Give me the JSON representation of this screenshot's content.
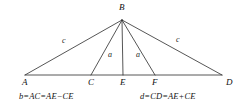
{
  "figure": {
    "type": "geometry-diagram",
    "background_color": "#ffffff",
    "stroke_color": "#2b2b2b",
    "stroke_width": 0.8,
    "canvas": {
      "width": 245,
      "height": 110
    },
    "points": [
      {
        "id": "A",
        "label": "A",
        "x": 25,
        "y": 75,
        "label_x": 22,
        "label_y": 78
      },
      {
        "id": "B",
        "label": "B",
        "x": 122,
        "y": 20,
        "label_x": 119,
        "label_y": 3
      },
      {
        "id": "C",
        "label": "C",
        "x": 91,
        "y": 75,
        "label_x": 88,
        "label_y": 78
      },
      {
        "id": "E",
        "label": "E",
        "x": 123,
        "y": 75,
        "label_x": 120,
        "label_y": 78
      },
      {
        "id": "F",
        "label": "F",
        "x": 155,
        "y": 75,
        "label_x": 152,
        "label_y": 78
      },
      {
        "id": "D",
        "label": "D",
        "x": 222,
        "y": 75,
        "label_x": 226,
        "label_y": 78
      }
    ],
    "segments": [
      {
        "name": "baseline-AD",
        "x1": 25,
        "y1": 75,
        "x2": 222,
        "y2": 75
      },
      {
        "name": "side-BA",
        "x1": 122,
        "y1": 20,
        "x2": 25,
        "y2": 75
      },
      {
        "name": "side-BD",
        "x1": 122,
        "y1": 20,
        "x2": 222,
        "y2": 75
      },
      {
        "name": "cevian-BC",
        "x1": 122,
        "y1": 20,
        "x2": 91,
        "y2": 75
      },
      {
        "name": "cevian-BE",
        "x1": 122,
        "y1": 20,
        "x2": 123,
        "y2": 75
      },
      {
        "name": "cevian-BF",
        "x1": 122,
        "y1": 20,
        "x2": 155,
        "y2": 75
      }
    ],
    "side_labels": [
      {
        "id": "c-left",
        "label": "c",
        "x": 62,
        "y": 37
      },
      {
        "id": "c-right",
        "label": "c",
        "x": 176,
        "y": 36
      },
      {
        "id": "a-left",
        "label": "a",
        "x": 108,
        "y": 51
      },
      {
        "id": "a-right",
        "label": "a",
        "x": 136,
        "y": 51
      }
    ],
    "captions": [
      {
        "id": "caption-left",
        "text": "b=AC=AE−CE",
        "x": 19,
        "y": 92
      },
      {
        "id": "caption-right",
        "text": "d=CD=AE+CE",
        "x": 140,
        "y": 92
      }
    ]
  }
}
